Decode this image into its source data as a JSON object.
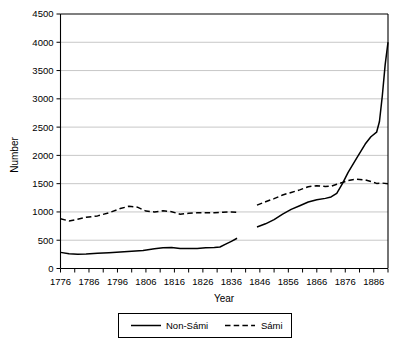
{
  "chart_data": {
    "type": "line",
    "title": "",
    "xlabel": "Year",
    "ylabel": "Number",
    "xlim": [
      1776,
      1891
    ],
    "ylim": [
      0,
      4500
    ],
    "grid": true,
    "legend_position": "bottom",
    "x_ticks_major": [
      1776,
      1786,
      1796,
      1806,
      1816,
      1826,
      1836,
      1846,
      1856,
      1866,
      1876,
      1886
    ],
    "x_tick_labels": [
      "1776",
      "1786",
      "1796",
      "1806",
      "1816",
      "1826",
      "1836",
      "1846",
      "1856",
      "1866",
      "1876",
      "1886"
    ],
    "x_ticks_minor_step": 5,
    "y_ticks": [
      0,
      500,
      1000,
      1500,
      2000,
      2500,
      3000,
      3500,
      4000,
      4500
    ],
    "y_tick_labels": [
      "0",
      "500",
      "1000",
      "1500",
      "2000",
      "2500",
      "3000",
      "3500",
      "4000",
      "4500"
    ],
    "series": [
      {
        "name": "Non-Sámi",
        "style": "solid",
        "color": "#000000",
        "segments": [
          {
            "x": [
              1776,
              1779,
              1782,
              1785,
              1789,
              1793,
              1797,
              1801,
              1805,
              1809,
              1812,
              1815,
              1818,
              1821,
              1824,
              1827,
              1830,
              1832,
              1834,
              1836,
              1838
            ],
            "y": [
              285,
              260,
              252,
              255,
              268,
              280,
              292,
              305,
              318,
              348,
              368,
              372,
              355,
              352,
              355,
              368,
              372,
              380,
              430,
              480,
              535
            ]
          },
          {
            "x": [
              1845,
              1848,
              1851,
              1854,
              1857,
              1860,
              1863,
              1866,
              1869,
              1871,
              1873,
              1875,
              1877,
              1880,
              1883,
              1885,
              1887,
              1888,
              1889,
              1890,
              1891
            ],
            "y": [
              735,
              790,
              865,
              960,
              1045,
              1110,
              1175,
              1215,
              1240,
              1265,
              1330,
              1500,
              1700,
              1950,
              2200,
              2330,
              2410,
              2600,
              3050,
              3600,
              4000
            ]
          }
        ]
      },
      {
        "name": "Sámi",
        "style": "dashed",
        "color": "#000000",
        "segments": [
          {
            "x": [
              1776,
              1779,
              1782,
              1785,
              1789,
              1793,
              1797,
              1800,
              1803,
              1806,
              1809,
              1812,
              1815,
              1818,
              1821,
              1824,
              1827,
              1830,
              1833,
              1836,
              1838
            ],
            "y": [
              880,
              840,
              870,
              905,
              930,
              985,
              1060,
              1100,
              1085,
              1015,
              1000,
              1020,
              1005,
              960,
              975,
              985,
              985,
              985,
              995,
              1000,
              995
            ]
          },
          {
            "x": [
              1845,
              1848,
              1851,
              1854,
              1857,
              1860,
              1863,
              1866,
              1869,
              1871,
              1873,
              1875,
              1877,
              1880,
              1883,
              1885,
              1887,
              1889,
              1891
            ],
            "y": [
              1120,
              1180,
              1235,
              1300,
              1345,
              1390,
              1445,
              1465,
              1450,
              1455,
              1490,
              1520,
              1555,
              1580,
              1565,
              1540,
              1505,
              1510,
              1500
            ]
          }
        ]
      }
    ]
  },
  "legend": {
    "items": [
      {
        "label": "Non-Sámi",
        "style": "solid"
      },
      {
        "label": "Sámi",
        "style": "dashed"
      }
    ]
  }
}
